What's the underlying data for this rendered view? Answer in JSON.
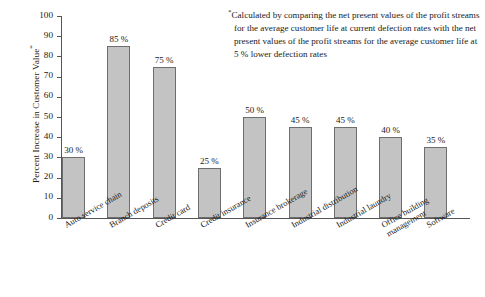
{
  "chart_data": {
    "type": "bar",
    "title": "",
    "xlabel": "",
    "ylabel": "Percent Increase in Customer Value",
    "ylabel_suffix": "*",
    "ylim": [
      0,
      100
    ],
    "ytick_step": 10,
    "grid": false,
    "legend": "none",
    "categories": [
      "Auto service chain",
      "Branch deposits",
      "Credit card",
      "Credit insurance",
      "Insurance brokerage",
      "Industrial distribution",
      "Industrial laundry",
      "Office building\nmanagement",
      "Software"
    ],
    "values": [
      30,
      85,
      75,
      25,
      50,
      45,
      45,
      40,
      35
    ],
    "value_labels": [
      "30 %",
      "85 %",
      "75 %",
      "25 %",
      "50 %",
      "45 %",
      "45 %",
      "40 %",
      "35 %"
    ],
    "ytick_labels": [
      "100",
      "90",
      "80",
      "70",
      "60",
      "50",
      "40",
      "30",
      "20",
      "10",
      "0"
    ],
    "bar_color": "#c3c3c3",
    "bar_border_color": "#6e6e6e",
    "axis_color": "#555555",
    "annotations": [
      {
        "marker": "*",
        "text": "Calculated by comparing the net present values of the profit streams for the average customer life at current defection rates with the net present values of the profit streams for the average customer life at 5 % lower defection rates"
      }
    ]
  }
}
